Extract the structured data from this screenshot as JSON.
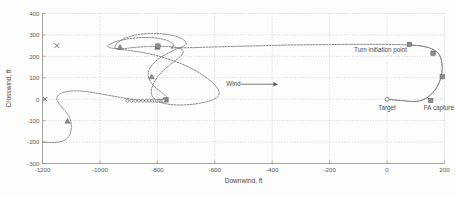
{
  "figure": {
    "background": "#fdfdfc",
    "line_color": "#6e6e6e",
    "grid_color": "#b9b9b9",
    "frame_color": "#7d7d7d"
  },
  "chart_data": {
    "type": "line",
    "title": "",
    "xlabel": "Downwind, ft",
    "ylabel": "Crosswind, ft",
    "xlim": [
      -1200,
      200
    ],
    "ylim": [
      400,
      -300
    ],
    "y_inverted": true,
    "grid": true,
    "legend": null,
    "xticks": [
      -1200,
      -1000,
      -800,
      -600,
      -400,
      -200,
      0,
      200
    ],
    "xticklabels": [
      "-1200",
      "-1000",
      "-800",
      "-600",
      "-400",
      "-200",
      "0",
      "200"
    ],
    "yticks": [
      -300,
      -200,
      -100,
      0,
      100,
      200,
      300,
      400
    ],
    "yticklabels": [
      "-300",
      "-200",
      "-100",
      "0",
      "100",
      "200",
      "300",
      "400"
    ],
    "series": [
      {
        "name": "flight trajectory",
        "style": "dotted-gray",
        "points": [
          [
            -1200,
            -200
          ],
          [
            -1170,
            -202
          ],
          [
            -1145,
            -200
          ],
          [
            -1125,
            -193
          ],
          [
            -1112,
            -180
          ],
          [
            -1104,
            -162
          ],
          [
            -1100,
            -140
          ],
          [
            -1100,
            -116
          ],
          [
            -1103,
            -95
          ],
          [
            -1110,
            -75
          ],
          [
            -1120,
            -57
          ],
          [
            -1131,
            -40
          ],
          [
            -1140,
            -24
          ],
          [
            -1147,
            -10
          ],
          [
            -1150,
            2
          ],
          [
            -1148,
            14
          ],
          [
            -1140,
            24
          ],
          [
            -1127,
            32
          ],
          [
            -1110,
            37
          ],
          [
            -1090,
            39
          ],
          [
            -1065,
            38
          ],
          [
            -1035,
            33
          ],
          [
            -1002,
            26
          ],
          [
            -968,
            18
          ],
          [
            -935,
            10
          ],
          [
            -905,
            3
          ],
          [
            -878,
            -2
          ],
          [
            -855,
            -5
          ],
          [
            -836,
            -7
          ],
          [
            -820,
            -8
          ],
          [
            -806,
            -8
          ],
          [
            -793,
            -8
          ],
          [
            -782,
            -7
          ],
          [
            -774,
            -6
          ],
          [
            -769,
            -4
          ],
          [
            -766,
            0
          ],
          [
            -766,
            6
          ],
          [
            -770,
            14
          ],
          [
            -778,
            24
          ],
          [
            -790,
            36
          ],
          [
            -803,
            50
          ],
          [
            -815,
            66
          ],
          [
            -824,
            82
          ],
          [
            -830,
            99
          ],
          [
            -832,
            116
          ],
          [
            -830,
            133
          ],
          [
            -824,
            150
          ],
          [
            -814,
            167
          ],
          [
            -801,
            183
          ],
          [
            -786,
            197
          ],
          [
            -770,
            210
          ],
          [
            -754,
            221
          ],
          [
            -740,
            230
          ],
          [
            -728,
            237
          ],
          [
            -719,
            242
          ],
          [
            -712,
            246
          ],
          [
            -707,
            249
          ],
          [
            -703,
            252
          ],
          [
            -700,
            256
          ],
          [
            -700,
            262
          ],
          [
            -703,
            270
          ],
          [
            -711,
            279
          ],
          [
            -724,
            288
          ],
          [
            -742,
            296
          ],
          [
            -764,
            302
          ],
          [
            -790,
            306
          ],
          [
            -818,
            307
          ],
          [
            -846,
            305
          ],
          [
            -873,
            300
          ],
          [
            -897,
            292
          ],
          [
            -917,
            282
          ],
          [
            -932,
            270
          ],
          [
            -942,
            258
          ],
          [
            -947,
            247
          ],
          [
            -948,
            240
          ],
          [
            -945,
            236
          ],
          [
            -939,
            234
          ],
          [
            -928,
            234
          ],
          [
            -914,
            236
          ],
          [
            -897,
            239
          ],
          [
            -877,
            242
          ],
          [
            -856,
            244
          ],
          [
            -833,
            246
          ],
          [
            -809,
            247
          ],
          [
            -786,
            247
          ],
          [
            -764,
            246
          ],
          [
            -745,
            244
          ],
          [
            -730,
            241
          ],
          [
            -719,
            236
          ],
          [
            -713,
            230
          ],
          [
            -710,
            222
          ],
          [
            -712,
            213
          ],
          [
            -718,
            202
          ],
          [
            -728,
            190
          ],
          [
            -742,
            176
          ],
          [
            -757,
            160
          ],
          [
            -772,
            143
          ],
          [
            -786,
            125
          ],
          [
            -798,
            106
          ],
          [
            -808,
            87
          ],
          [
            -815,
            68
          ],
          [
            -820,
            50
          ],
          [
            -821,
            33
          ],
          [
            -819,
            18
          ],
          [
            -813,
            5
          ],
          [
            -804,
            -5
          ],
          [
            -792,
            -13
          ],
          [
            -778,
            -19
          ],
          [
            -762,
            -23
          ],
          [
            -744,
            -26
          ],
          [
            -724,
            -27
          ],
          [
            -702,
            -26
          ],
          [
            -680,
            -24
          ],
          [
            -658,
            -20
          ],
          [
            -638,
            -15
          ],
          [
            -620,
            -9
          ],
          [
            -606,
            -2
          ],
          [
            -595,
            6
          ],
          [
            -588,
            15
          ],
          [
            -585,
            26
          ],
          [
            -586,
            39
          ],
          [
            -592,
            54
          ],
          [
            -602,
            70
          ],
          [
            -617,
            88
          ],
          [
            -636,
            107
          ],
          [
            -659,
            127
          ],
          [
            -685,
            146
          ],
          [
            -714,
            164
          ],
          [
            -745,
            180
          ],
          [
            -777,
            194
          ],
          [
            -809,
            206
          ],
          [
            -840,
            215
          ],
          [
            -869,
            222
          ],
          [
            -896,
            227
          ],
          [
            -920,
            231
          ],
          [
            -940,
            235
          ],
          [
            -956,
            238
          ],
          [
            -966,
            241
          ],
          [
            -972,
            244
          ],
          [
            -973,
            248
          ],
          [
            -970,
            253
          ],
          [
            -962,
            259
          ],
          [
            -950,
            266
          ],
          [
            -933,
            273
          ],
          [
            -913,
            279
          ],
          [
            -890,
            284
          ],
          [
            -866,
            287
          ],
          [
            -842,
            288
          ],
          [
            -818,
            287
          ],
          [
            -796,
            284
          ],
          [
            -777,
            279
          ],
          [
            -762,
            272
          ],
          [
            -751,
            264
          ],
          [
            -745,
            256
          ],
          [
            -744,
            249
          ],
          [
            -747,
            243
          ],
          [
            -753,
            239
          ],
          [
            -740,
            239
          ],
          [
            -710,
            240
          ],
          [
            -670,
            241
          ],
          [
            -625,
            243
          ],
          [
            -575,
            245
          ],
          [
            -520,
            247
          ],
          [
            -462,
            249
          ],
          [
            -400,
            251
          ],
          [
            -335,
            253
          ],
          [
            -268,
            254
          ],
          [
            -200,
            255
          ],
          [
            -135,
            256
          ],
          [
            -72,
            256
          ],
          [
            -14,
            256
          ],
          [
            38,
            255
          ],
          [
            80,
            253
          ],
          [
            110,
            250
          ],
          [
            135,
            244
          ],
          [
            154,
            236
          ],
          [
            168,
            226
          ],
          [
            178,
            214
          ],
          [
            185,
            200
          ],
          [
            189,
            184
          ],
          [
            191,
            166
          ],
          [
            192,
            146
          ],
          [
            191,
            125
          ],
          [
            188,
            104
          ],
          [
            183,
            83
          ],
          [
            176,
            62
          ],
          [
            167,
            43
          ],
          [
            156,
            26
          ],
          [
            144,
            12
          ],
          [
            131,
            1
          ],
          [
            118,
            -6
          ],
          [
            105,
            -10
          ],
          [
            92,
            -11
          ],
          [
            78,
            -10
          ],
          [
            64,
            -8
          ],
          [
            50,
            -6
          ],
          [
            36,
            -5
          ],
          [
            22,
            -3
          ],
          [
            10,
            -2
          ],
          [
            0,
            0
          ]
        ]
      }
    ],
    "markers": [
      {
        "name": "x-marker-start-left",
        "shape": "x",
        "x": -1191,
        "y": 0
      },
      {
        "name": "x-marker-lower-left",
        "shape": "x",
        "x": -1150,
        "y": 250
      },
      {
        "name": "triangle-upper-left",
        "shape": "triangle",
        "x": -1113,
        "y": -102
      },
      {
        "name": "triangle-mid-left",
        "shape": "triangle",
        "x": -820,
        "y": 105
      },
      {
        "name": "triangle-bottom-a",
        "shape": "triangle",
        "x": -930,
        "y": 243
      },
      {
        "name": "triangle-bottom-b",
        "shape": "triangle",
        "x": -800,
        "y": 243
      },
      {
        "name": "square-center",
        "shape": "square",
        "x": -770,
        "y": -3
      },
      {
        "name": "square-bottom",
        "shape": "square",
        "x": -798,
        "y": 248
      },
      {
        "name": "square-turn-init",
        "shape": "square",
        "x": 78,
        "y": 256
      },
      {
        "name": "square-right-lower",
        "shape": "square",
        "x": 160,
        "y": 215
      },
      {
        "name": "square-right-mid",
        "shape": "square",
        "x": 192,
        "y": 105
      },
      {
        "name": "square-fa-capture",
        "shape": "square",
        "x": 152,
        "y": -6
      },
      {
        "name": "target-circle",
        "shape": "circle",
        "x": 0,
        "y": 0
      }
    ],
    "marker_chain": {
      "name": "circle-marker-chain",
      "shape": "circle",
      "y": -7,
      "x_values": [
        -905,
        -891,
        -877,
        -864,
        -851,
        -839,
        -828,
        -818,
        -809,
        -801,
        -794,
        -788,
        -783,
        -779
      ]
    },
    "annotations": [
      {
        "name": "annotation-target",
        "text": "Target",
        "x": 0,
        "y": -52,
        "align": "middle"
      },
      {
        "name": "annotation-fa-capture",
        "text": "FA capture",
        "x": 128,
        "y": -52,
        "align": "start"
      },
      {
        "name": "annotation-turn-initiation",
        "text": "Turn initiation point",
        "x": -115,
        "y": 222,
        "align": "start"
      },
      {
        "name": "annotation-wind",
        "text": "Wind",
        "x": -560,
        "y": 62,
        "align": "start"
      }
    ],
    "wind_arrow": {
      "x_start": -510,
      "x_end": -380,
      "y": 70,
      "direction": "right"
    }
  }
}
